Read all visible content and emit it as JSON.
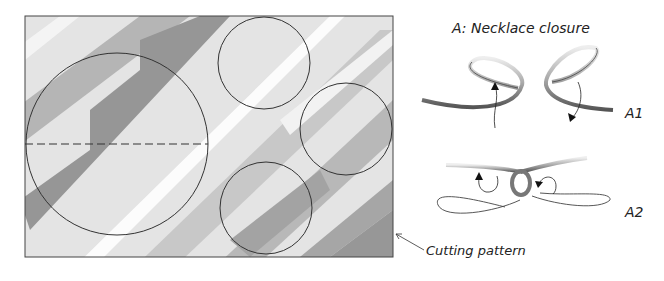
{
  "title": "A: Necklace closure",
  "steps": [
    {
      "label": "A1"
    },
    {
      "label": "A2"
    }
  ],
  "callout": "Cutting pattern",
  "pattern": {
    "sheet": {
      "x": 25,
      "y": 16,
      "w": 368,
      "h": 241
    },
    "circles": [
      {
        "name": "large-circle",
        "cx": 117,
        "cy": 144,
        "r": 91
      },
      {
        "name": "small-circle-top",
        "cx": 264,
        "cy": 63,
        "r": 46
      },
      {
        "name": "small-circle-right",
        "cx": 346,
        "cy": 129,
        "r": 46
      },
      {
        "name": "small-circle-bottom",
        "cx": 266,
        "cy": 208,
        "r": 46
      }
    ],
    "dashed_line": {
      "x1": 25,
      "y1": 144,
      "x2": 208,
      "y2": 144
    }
  },
  "colors": {
    "stroke": "#333333",
    "stripe_dark": "#8a8a8a",
    "stripe_mid": "#b8b8b8",
    "paper": "#e6e6e6"
  }
}
